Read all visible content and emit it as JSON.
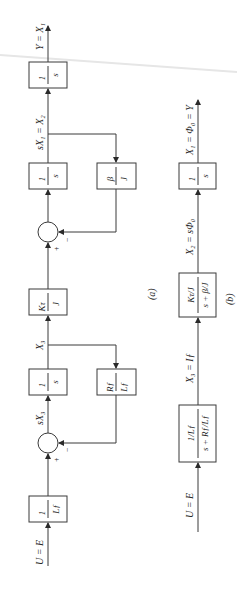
{
  "diagram_a": {
    "caption": "(a)",
    "input_label": "U = E",
    "output_label": "Y = X₁",
    "blocks": [
      {
        "id": "a1",
        "num": "1",
        "den": "L_f",
        "num_disp": "1",
        "den_disp": "Lƒ"
      },
      {
        "id": "a2",
        "num": "1",
        "den": "s",
        "num_disp": "1",
        "den_disp": "s"
      },
      {
        "id": "a3",
        "num": "R_f",
        "den": "L_f",
        "num_disp": "Rƒ",
        "den_disp": "Lƒ"
      },
      {
        "id": "a4",
        "num": "K_τ",
        "den": "J",
        "num_disp": "Kτ",
        "den_disp": "J"
      },
      {
        "id": "a5",
        "num": "1",
        "den": "s",
        "num_disp": "1",
        "den_disp": "s"
      },
      {
        "id": "a6",
        "num": "β",
        "den": "J",
        "num_disp": "β",
        "den_disp": "J"
      },
      {
        "id": "a7",
        "num": "1",
        "den": "s",
        "num_disp": "1",
        "den_disp": "s"
      }
    ],
    "signals": {
      "sX3": "sX₃",
      "X3": "X₃",
      "sX1": "sX₁ = X₂"
    },
    "summers": [
      {
        "plus": "+",
        "minus": "−"
      },
      {
        "plus": "+",
        "minus": "−"
      }
    ]
  },
  "diagram_b": {
    "caption": "(b)",
    "input_label": "U = E",
    "output_label": "X₁ = Φ₀ = Y",
    "blocks": [
      {
        "id": "b1",
        "num_disp": "1/Lƒ",
        "den_disp": "s + Rƒ/Lƒ"
      },
      {
        "id": "b2",
        "num_disp": "Kτ/J",
        "den_disp": "s + β/J"
      },
      {
        "id": "b3",
        "num_disp": "1",
        "den_disp": "s"
      }
    ],
    "signals": {
      "X3": "X₃ = Iƒ",
      "X2": "X₂ = sΦ₀"
    }
  }
}
